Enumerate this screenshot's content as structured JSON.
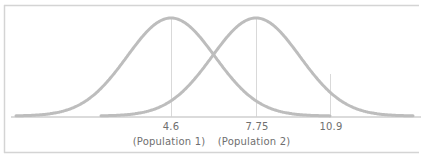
{
  "chart_data": {
    "type": "line",
    "title": "",
    "xlabel": "",
    "ylabel": "",
    "grid": false,
    "legend": null,
    "series": [
      {
        "name": "Population 1",
        "mean": 4.6,
        "shape": "normal-curve"
      },
      {
        "name": "Population 2",
        "mean": 7.75,
        "shape": "normal-curve"
      }
    ],
    "markers": [
      {
        "x": 4.6,
        "label": "4.6",
        "sublabel": "(Population 1)"
      },
      {
        "x": 7.75,
        "label": "7.75",
        "sublabel": "(Population 2)"
      },
      {
        "x": 10.9,
        "label": "10.9",
        "sublabel": ""
      }
    ]
  },
  "colors": {
    "curve": "#bdbdbd",
    "marker_line": "#d9d9d9",
    "frame": "#d4d4d4",
    "text": "#6f6f6f"
  }
}
